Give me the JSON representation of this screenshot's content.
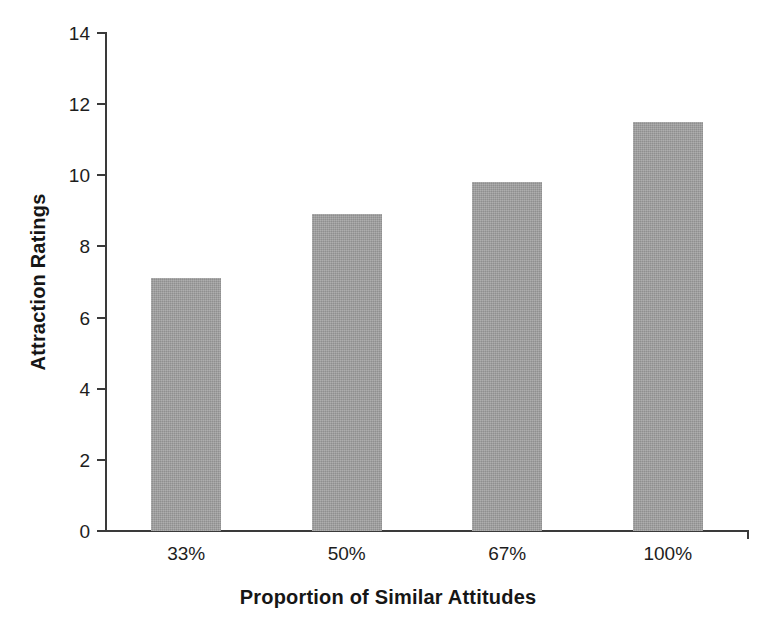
{
  "chart_data": {
    "type": "bar",
    "title": "",
    "xlabel": "Proportion of Similar Attitudes",
    "ylabel": "Attraction Ratings",
    "categories": [
      "33%",
      "50%",
      "67%",
      "100%"
    ],
    "values": [
      7.1,
      8.9,
      9.8,
      11.5
    ],
    "ylim": [
      0,
      14
    ],
    "ytick_labels": [
      "0",
      "2",
      "4",
      "6",
      "8",
      "10",
      "12",
      "14"
    ],
    "ytick_values": [
      0,
      2,
      4,
      6,
      8,
      10,
      12,
      14
    ],
    "ytick_step": 2,
    "grid": false,
    "legend": false,
    "legend_position": "none",
    "bar_color": "#9d9d9d",
    "axis_color": "#3a3a3a",
    "text_color": "#1d1d1d",
    "background": "#ffffff"
  }
}
